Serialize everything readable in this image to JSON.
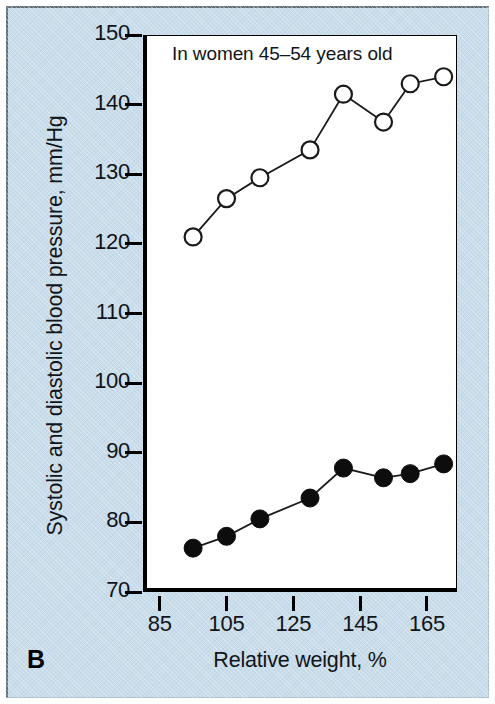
{
  "figure": {
    "panel_letter": "B",
    "background_color": "#c9dcea",
    "plot_background_color": "#ffffff",
    "ink_color": "#111418"
  },
  "chart_data": {
    "type": "line",
    "title": "",
    "annotation": "In women 45–54 years old",
    "xlabel": "Relative weight, %",
    "ylabel": "Systolic and diastolic blood pressure, mm/Hg",
    "xlim": [
      80,
      174
    ],
    "ylim": [
      70,
      150
    ],
    "xticks": [
      85,
      105,
      125,
      145,
      165
    ],
    "yticks": [
      70,
      80,
      90,
      100,
      110,
      120,
      130,
      140,
      150
    ],
    "xtick_labels": [
      "85",
      "105",
      "125",
      "145",
      "165"
    ],
    "ytick_labels": [
      "70",
      "80",
      "90",
      "100",
      "110",
      "120",
      "130",
      "140",
      "150"
    ],
    "grid": false,
    "legend": "none",
    "x": [
      95,
      105,
      115,
      130,
      140,
      152,
      160,
      170
    ],
    "series": [
      {
        "name": "Systolic blood pressure",
        "marker": "open-circle",
        "marker_fill": "#ffffff",
        "marker_edge": "#1a1a1a",
        "line_color": "#1a1a1a",
        "values": [
          121,
          126.5,
          129.5,
          133.5,
          141.5,
          137.5,
          143,
          144
        ]
      },
      {
        "name": "Diastolic blood pressure",
        "marker": "filled-circle",
        "marker_fill": "#0d0d0d",
        "marker_edge": "#0d0d0d",
        "line_color": "#1a1a1a",
        "values": [
          76.3,
          78,
          80.5,
          83.5,
          87.8,
          86.4,
          87,
          88.4
        ]
      }
    ]
  }
}
